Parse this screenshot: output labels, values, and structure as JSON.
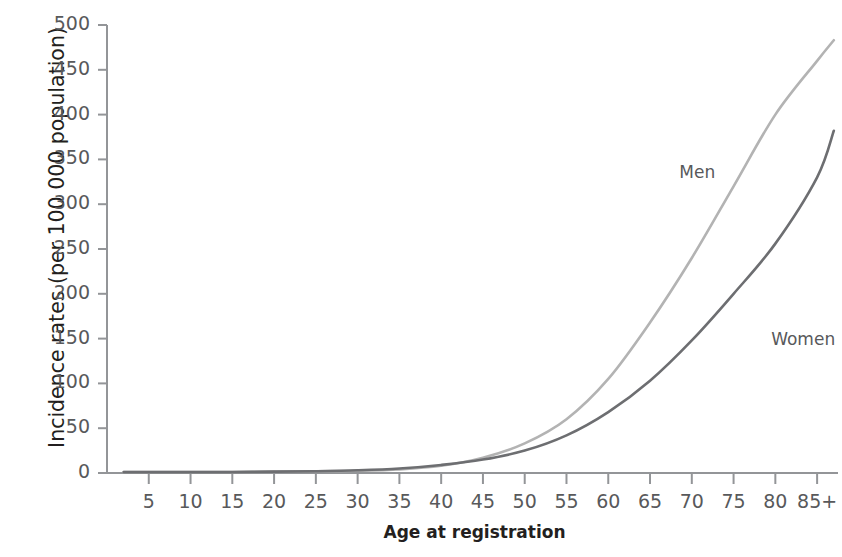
{
  "chart_data": {
    "type": "line",
    "title": "",
    "subtitle": "",
    "xlabel": "Age at registration",
    "ylabel": "Incidence rates (per 100 000 population)",
    "xlim": [
      0,
      87.5
    ],
    "ylim": [
      0,
      500
    ],
    "grid": false,
    "legend_position": "inline-annotation",
    "x_tick_labels": [
      "5",
      "10",
      "15",
      "20",
      "25",
      "30",
      "35",
      "40",
      "45",
      "50",
      "55",
      "60",
      "65",
      "70",
      "75",
      "80",
      "85+"
    ],
    "x_tick_values": [
      5,
      10,
      15,
      20,
      25,
      30,
      35,
      40,
      45,
      50,
      55,
      60,
      65,
      70,
      75,
      80,
      85
    ],
    "y_tick_labels": [
      "0",
      "50",
      "100",
      "150",
      "200",
      "250",
      "300",
      "350",
      "400",
      "450",
      "500"
    ],
    "y_tick_values": [
      0,
      50,
      100,
      150,
      200,
      250,
      300,
      350,
      400,
      450,
      500
    ],
    "categories": [
      2,
      5,
      10,
      15,
      20,
      25,
      30,
      35,
      40,
      45,
      50,
      55,
      60,
      65,
      70,
      75,
      80,
      85,
      87
    ],
    "series": [
      {
        "name": "Men",
        "color": "#b3b3b3",
        "label_text": "Men",
        "values": [
          1,
          1,
          1,
          1,
          1.5,
          2,
          2.5,
          4,
          8,
          17,
          33,
          60,
          105,
          168,
          240,
          320,
          400,
          460,
          483
        ]
      },
      {
        "name": "Women",
        "color": "#6d6e71",
        "label_text": "Women",
        "values": [
          1,
          1,
          1,
          1,
          1.5,
          2,
          3,
          5,
          9,
          15,
          25,
          42,
          68,
          103,
          148,
          200,
          256,
          330,
          382
        ]
      }
    ],
    "annotations": [
      {
        "text": "Men",
        "x": 68.5,
        "y": 335
      },
      {
        "text": "Women",
        "x": 79.5,
        "y": 148
      }
    ]
  },
  "axis": {
    "y_label": "Incidence rates (per 100 000 population)",
    "x_label": "Age at registration"
  },
  "colors": {
    "men_line": "#b3b3b3",
    "women_line": "#6d6e71",
    "axis": "#939598",
    "tick_text": "#58595b",
    "label_text": "#231f20",
    "background": "#ffffff"
  }
}
